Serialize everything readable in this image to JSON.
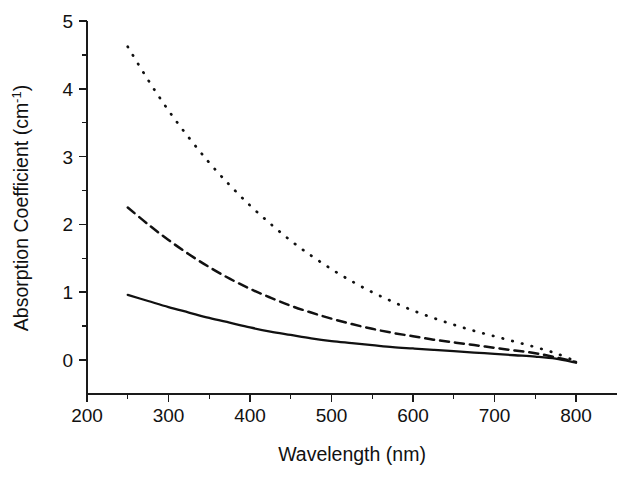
{
  "chart_data": {
    "type": "line",
    "title": "",
    "xlabel": "Wavelength (nm)",
    "ylabel_text": "Absorption Coefficient (cm",
    "ylabel_sup": "-1",
    "ylabel_tail": ")",
    "ylabel_full": "Absorption Coefficient (cm-1)",
    "xlim": [
      200,
      810
    ],
    "ylim": [
      -0.12,
      5.0
    ],
    "grid": false,
    "legend": "none",
    "x_ticks_major": [
      200,
      300,
      400,
      500,
      600,
      700,
      800
    ],
    "x_ticks_major_labels": [
      "200",
      "300",
      "400",
      "500",
      "600",
      "700",
      "800"
    ],
    "x_ticks_minor": [
      250,
      350,
      450,
      550,
      650,
      750
    ],
    "y_ticks_major": [
      0,
      1,
      2,
      3,
      4,
      5
    ],
    "y_ticks_major_labels": [
      "0",
      "1",
      "2",
      "3",
      "4",
      "5"
    ],
    "y_ticks_minor": [
      0.5,
      1.5,
      2.5,
      3.5,
      4.5
    ],
    "x": [
      250,
      275,
      300,
      325,
      350,
      375,
      400,
      425,
      450,
      475,
      500,
      525,
      550,
      575,
      600,
      625,
      650,
      675,
      700,
      725,
      750,
      775,
      800
    ],
    "series": [
      {
        "name": "upper-curve",
        "style": "dotted",
        "values": [
          4.62,
          4.13,
          3.68,
          3.28,
          2.91,
          2.58,
          2.28,
          2.01,
          1.76,
          1.54,
          1.34,
          1.16,
          1.0,
          0.86,
          0.73,
          0.62,
          0.52,
          0.43,
          0.35,
          0.27,
          0.19,
          0.1,
          -0.02
        ]
      },
      {
        "name": "middle-curve",
        "style": "dashed",
        "values": [
          2.25,
          2.0,
          1.77,
          1.56,
          1.37,
          1.2,
          1.05,
          0.92,
          0.8,
          0.7,
          0.61,
          0.53,
          0.46,
          0.4,
          0.35,
          0.3,
          0.26,
          0.22,
          0.18,
          0.14,
          0.1,
          0.04,
          -0.03
        ]
      },
      {
        "name": "lower-curve",
        "style": "solid",
        "values": [
          0.96,
          0.87,
          0.78,
          0.7,
          0.62,
          0.55,
          0.48,
          0.42,
          0.37,
          0.32,
          0.28,
          0.25,
          0.22,
          0.19,
          0.17,
          0.15,
          0.13,
          0.11,
          0.09,
          0.07,
          0.05,
          0.02,
          -0.04
        ]
      }
    ],
    "colors": {
      "axis": "#1a1a1a",
      "series": "#111111",
      "background": "#ffffff"
    },
    "geometry": {
      "x_px_200": 87,
      "x_px_800": 576,
      "y_px_0": 360,
      "y_px_5": 21,
      "axis_x_end": 617,
      "axis_y_bottom": 394
    }
  }
}
